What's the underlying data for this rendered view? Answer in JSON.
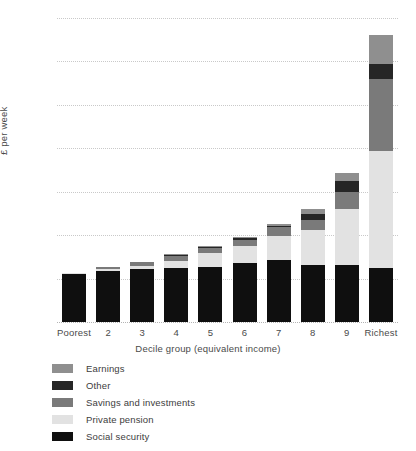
{
  "chart_data": {
    "type": "bar",
    "subtype": "stacked-bar",
    "title": "",
    "xlabel": "Decile group (equivalent income)",
    "ylabel": "£ per week",
    "ylim": [
      0,
      350
    ],
    "ytick_step": 50,
    "yticks": [
      "0",
      "50",
      "100",
      "150",
      "200",
      "250",
      "300",
      "350"
    ],
    "grid": true,
    "legend_position": "below-left",
    "categories": [
      "Poorest",
      "2",
      "3",
      "4",
      "5",
      "6",
      "7",
      "8",
      "9",
      "Richest"
    ],
    "series": [
      {
        "name": "Social security",
        "color": "#0f0f0f",
        "values": [
          55,
          59,
          61,
          62,
          63,
          68,
          71,
          66,
          66,
          62
        ]
      },
      {
        "name": "Private pension",
        "color": "#e2e2e2",
        "values": [
          1,
          2,
          4,
          8,
          16,
          19,
          28,
          40,
          64,
          135
        ]
      },
      {
        "name": "Savings and investments",
        "color": "#7a7a7a",
        "values": [
          1,
          2,
          4,
          6,
          6,
          8,
          10,
          11,
          20,
          83
        ]
      },
      {
        "name": "Other",
        "color": "#262626",
        "values": [
          0,
          0,
          0,
          1,
          1,
          2,
          2,
          7,
          12,
          17
        ]
      },
      {
        "name": "Earnings",
        "color": "#8f8f8f",
        "values": [
          0,
          0,
          0,
          1,
          1,
          1,
          2,
          6,
          10,
          33
        ]
      }
    ],
    "totals": [
      57,
      63,
      69,
      78,
      87,
      98,
      113,
      130,
      172,
      330
    ]
  },
  "legend": {
    "items": [
      {
        "label": "Earnings",
        "color": "#8f8f8f"
      },
      {
        "label": "Other",
        "color": "#262626"
      },
      {
        "label": "Savings and investments",
        "color": "#7a7a7a"
      },
      {
        "label": "Private pension",
        "color": "#e2e2e2"
      },
      {
        "label": "Social security",
        "color": "#0f0f0f"
      }
    ]
  }
}
